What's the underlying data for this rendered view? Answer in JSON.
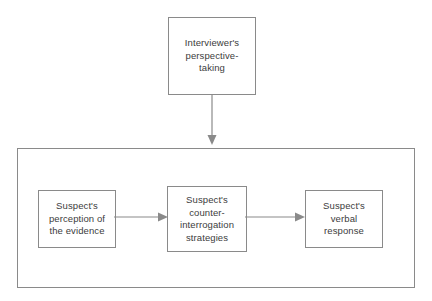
{
  "diagram": {
    "stroke_color": "#8a8a8a",
    "text_color": "#3c3c3c",
    "background_color": "#ffffff",
    "nodes": [
      {
        "id": "interviewer-perspective-taking",
        "label": "Interviewer's perspective-taking"
      },
      {
        "id": "suspect-perception-of-evidence",
        "label": "Suspect's perception of the evidence"
      },
      {
        "id": "suspect-counter-interrogation-strategies",
        "label": "Suspect's counter-interrogation strategies"
      },
      {
        "id": "suspect-verbal-response",
        "label": "Suspect's verbal response"
      }
    ],
    "container": {
      "id": "suspect-process-container",
      "label": ""
    },
    "arrows": [
      {
        "id": "interviewer-to-container",
        "direction": "down"
      },
      {
        "id": "perception-to-counter",
        "direction": "right"
      },
      {
        "id": "counter-to-verbal",
        "direction": "right"
      }
    ]
  }
}
